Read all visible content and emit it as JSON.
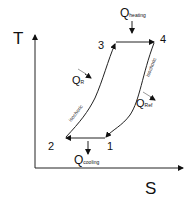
{
  "axes": {
    "y_label": "T",
    "x_label": "S"
  },
  "points": [
    {
      "id": "1",
      "label": "1"
    },
    {
      "id": "2",
      "label": "2"
    },
    {
      "id": "3",
      "label": "3"
    },
    {
      "id": "4",
      "label": "4"
    }
  ],
  "curve_labels": {
    "left": "isochoric",
    "right": "isochoric"
  },
  "heat_flows": {
    "heating": {
      "main": "Q",
      "sub": "heating"
    },
    "cooling": {
      "main": "Q",
      "sub": "cooling"
    },
    "regen_in": {
      "main": "Q",
      "sub": "R"
    },
    "regen_out": {
      "main": "Q",
      "sub": "Ref"
    }
  },
  "colors": {
    "line": "#222222",
    "hint_arrow": "#999999"
  }
}
